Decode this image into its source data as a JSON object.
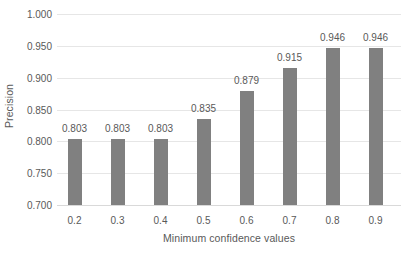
{
  "chart_data": {
    "type": "bar",
    "title": "",
    "xlabel": "Minimum confidence values",
    "ylabel": "Precision",
    "categories": [
      "0.2",
      "0.3",
      "0.4",
      "0.5",
      "0.6",
      "0.7",
      "0.8",
      "0.9"
    ],
    "values": [
      0.803,
      0.803,
      0.803,
      0.835,
      0.879,
      0.915,
      0.946,
      0.946
    ],
    "data_labels": [
      "0.803",
      "0.803",
      "0.803",
      "0.835",
      "0.879",
      "0.915",
      "0.946",
      "0.946"
    ],
    "ylim": [
      0.7,
      1.0
    ],
    "ytick_labels": [
      "1.000",
      "0.950",
      "0.900",
      "0.850",
      "0.800",
      "0.750",
      "0.700"
    ],
    "ytick_values": [
      1.0,
      0.95,
      0.9,
      0.85,
      0.8,
      0.75,
      0.7
    ],
    "ytick_step": 0.05,
    "grid": true,
    "legend": false,
    "legend_position": "none",
    "series_color": "#808080",
    "gridline_color": "#e6e6e6",
    "text_color": "#595959",
    "background_color": "#ffffff"
  }
}
